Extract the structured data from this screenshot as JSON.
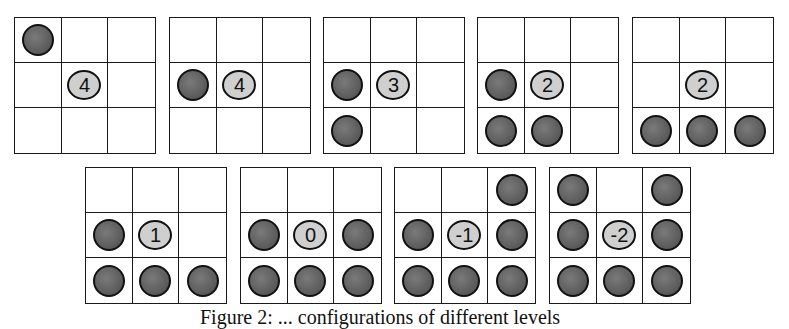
{
  "figure": {
    "caption": "Figure 2: ... configurations of different levels",
    "colors": {
      "grid_line": "#1a1a1a",
      "stone_fill": "#5e5e5e",
      "marker_fill": "#cfcfcf",
      "background": "#ffffff"
    },
    "boards": [
      {
        "label": "4",
        "cells": [
          "S",
          "",
          "",
          "",
          "M",
          "",
          "",
          "",
          ""
        ]
      },
      {
        "label": "4",
        "cells": [
          "",
          "",
          "",
          "S",
          "M",
          "",
          "",
          "",
          ""
        ]
      },
      {
        "label": "3",
        "cells": [
          "",
          "",
          "",
          "S",
          "M",
          "",
          "S",
          "",
          ""
        ]
      },
      {
        "label": "2",
        "cells": [
          "",
          "",
          "",
          "S",
          "M",
          "",
          "S",
          "S",
          ""
        ]
      },
      {
        "label": "2",
        "cells": [
          "",
          "",
          "",
          "",
          "M",
          "",
          "S",
          "S",
          "S"
        ]
      },
      {
        "label": "1",
        "cells": [
          "",
          "",
          "",
          "S",
          "M",
          "",
          "S",
          "S",
          "S"
        ]
      },
      {
        "label": "0",
        "cells": [
          "",
          "",
          "",
          "S",
          "M",
          "S",
          "S",
          "S",
          "S"
        ]
      },
      {
        "label": "-1",
        "cells": [
          "",
          "",
          "S",
          "S",
          "M",
          "S",
          "S",
          "S",
          "S"
        ]
      },
      {
        "label": "-2",
        "cells": [
          "S",
          "",
          "S",
          "S",
          "M",
          "S",
          "S",
          "S",
          "S"
        ]
      }
    ]
  },
  "chart_data": {
    "type": "table",
    "categories": [
      "board-1",
      "board-2",
      "board-3",
      "board-4",
      "board-5",
      "board-6",
      "board-7",
      "board-8",
      "board-9"
    ],
    "values": [
      4,
      4,
      3,
      2,
      2,
      1,
      0,
      -1,
      -2
    ],
    "stone_counts": [
      1,
      1,
      2,
      3,
      3,
      4,
      5,
      6,
      7
    ]
  }
}
